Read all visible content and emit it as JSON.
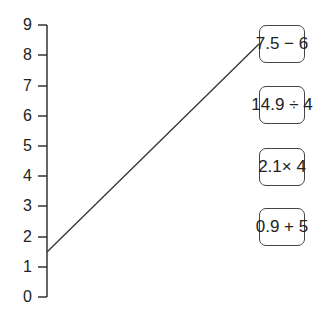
{
  "number_line": {
    "ticks": [
      "0",
      "1",
      "2",
      "3",
      "4",
      "5",
      "6",
      "7",
      "8",
      "9"
    ],
    "min": 0,
    "max": 9
  },
  "expressions": [
    {
      "label": "7.5 − 6",
      "value": 1.5,
      "connected": true
    },
    {
      "label": "14.9 ÷ 4",
      "value": 3.725,
      "connected": false
    },
    {
      "label": "2.1× 4",
      "value": 8.4,
      "connected": false
    },
    {
      "label": "0.9 + 5",
      "value": 5.9,
      "connected": false
    }
  ],
  "connection": {
    "from_value": 1.5,
    "to_box": 0
  }
}
